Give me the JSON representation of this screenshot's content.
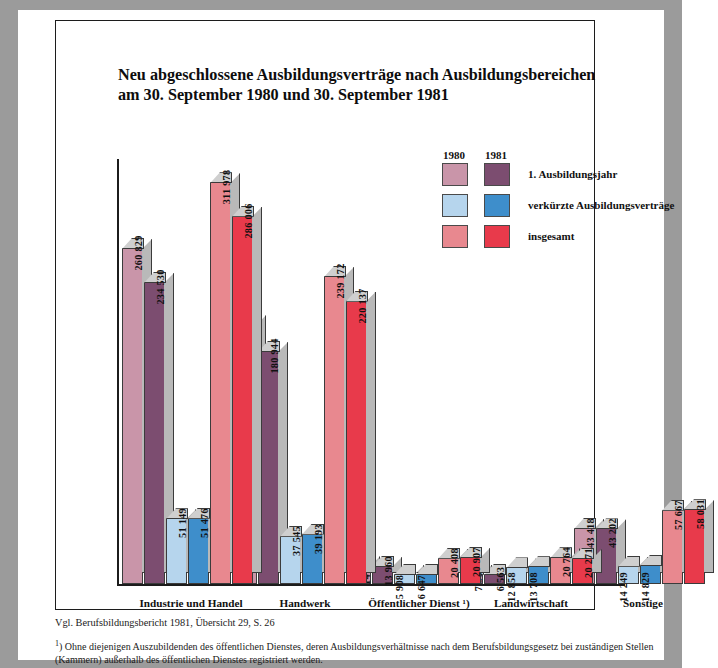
{
  "figure": {
    "label": "Schaubild 1",
    "title_line1": "Neu abgeschlossene Ausbildungsverträge nach Ausbildungsbereichen",
    "title_line2": "am 30. September 1980 und 30. September 1981",
    "source": "Vgl. Berufsbildungsbericht 1981, Übersicht 29, S. 26",
    "footnote_marker": "1",
    "footnote": ") Ohne diejenigen Auszubildenden des öffentlichen Dienstes, deren Ausbildungsverhältnisse nach dem Berufsbildungsgesetz bei zuständigen Stellen (Kammern) außerhalb des öffentlichen Dienstes registriert werden."
  },
  "legend": {
    "year_1980": "1980",
    "year_1981": "1981",
    "rows": [
      {
        "label": "1. Ausbildungsjahr",
        "color_1980": "#c995a9",
        "color_1981": "#7c4d70"
      },
      {
        "label": "verkürzte Ausbildungsverträge",
        "color_1980": "#b6d5ed",
        "color_1981": "#3e8ecb"
      },
      {
        "label": "insgesamt",
        "color_1980": "#e8888f",
        "color_1981": "#e83a4b"
      }
    ]
  },
  "chart_data": {
    "type": "bar",
    "title": "Neu abgeschlossene Ausbildungsverträge nach Ausbildungsbereichen am 30. September 1980 und 30. September 1981",
    "xlabel": "",
    "ylabel": "",
    "ylim": [
      0,
      330000
    ],
    "grid": false,
    "legend_position": "top-right",
    "categories": [
      "Industrie und Handel",
      "Handwerk",
      "Öffentlicher Dienst ¹)",
      "Landwirtschaft",
      "Sonstige"
    ],
    "series": [
      {
        "name": "1. Ausbildungsjahr 1980",
        "year": "1980",
        "measure": "1. Ausbildungsjahr",
        "color": "#c995a9",
        "values": [
          260829,
          201627,
          14500,
          7906,
          43418
        ],
        "labels": [
          "260 829",
          "201 627",
          "14 500",
          "7 906",
          "43 418"
        ]
      },
      {
        "name": "1. Ausbildungsjahr 1981",
        "year": "1981",
        "measure": "1. Ausbildungsjahr",
        "color": "#7c4d70",
        "values": [
          234530,
          180944,
          13960,
          6563,
          43202
        ],
        "labels": [
          "234 530",
          "180 944",
          "13 960",
          "6 563",
          "43 202"
        ]
      },
      {
        "name": "verkürzte Ausbildungsverträge 1980",
        "year": "1980",
        "measure": "verkürzte Ausbildungsverträge",
        "color": "#b6d5ed",
        "values": [
          51149,
          37545,
          5908,
          12858,
          14249
        ],
        "labels": [
          "51 149",
          "37 545",
          "5 908",
          "12 858",
          "14 249"
        ]
      },
      {
        "name": "verkürzte Ausbildungsverträge 1981",
        "year": "1981",
        "measure": "verkürzte Ausbildungsverträge",
        "color": "#3e8ecb",
        "values": [
          51476,
          39193,
          6647,
          13708,
          14829
        ],
        "labels": [
          "51 476",
          "39 193",
          "6 647",
          "13 708",
          "14 829"
        ]
      },
      {
        "name": "insgesamt 1980",
        "year": "1980",
        "measure": "insgesamt",
        "color": "#e8888f",
        "values": [
          311978,
          239172,
          20408,
          20764,
          57667
        ],
        "labels": [
          "311 978",
          "239 172",
          "20 408",
          "20 764",
          "57 667"
        ]
      },
      {
        "name": "insgesamt 1981",
        "year": "1981",
        "measure": "insgesamt",
        "color": "#e83a4b",
        "values": [
          286006,
          220137,
          20907,
          20271,
          58031
        ],
        "labels": [
          "286 006",
          "220 137",
          "20 907",
          "20 271",
          "58 031"
        ]
      }
    ]
  }
}
